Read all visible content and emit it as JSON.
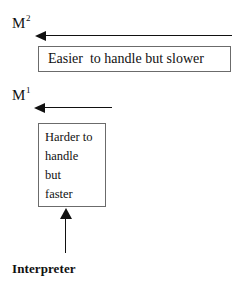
{
  "diagram": {
    "background_color": "#ffffff",
    "ink_color": "#111111",
    "box_border_color": "#6b6b6b",
    "levels": [
      {
        "id": "m2",
        "base": "M",
        "superscript": "2"
      },
      {
        "id": "m1",
        "base": "M",
        "superscript": "1"
      }
    ],
    "boxes": [
      {
        "id": "easier",
        "text": "Easier  to handle but slower"
      },
      {
        "id": "harder",
        "lines": [
          "Harder to",
          "handle",
          "but",
          "faster"
        ]
      }
    ],
    "arrows": [
      {
        "id": "top",
        "direction": "left"
      },
      {
        "id": "mid",
        "direction": "left"
      },
      {
        "id": "bottom",
        "direction": "up"
      }
    ],
    "caption": "Interpreter"
  }
}
